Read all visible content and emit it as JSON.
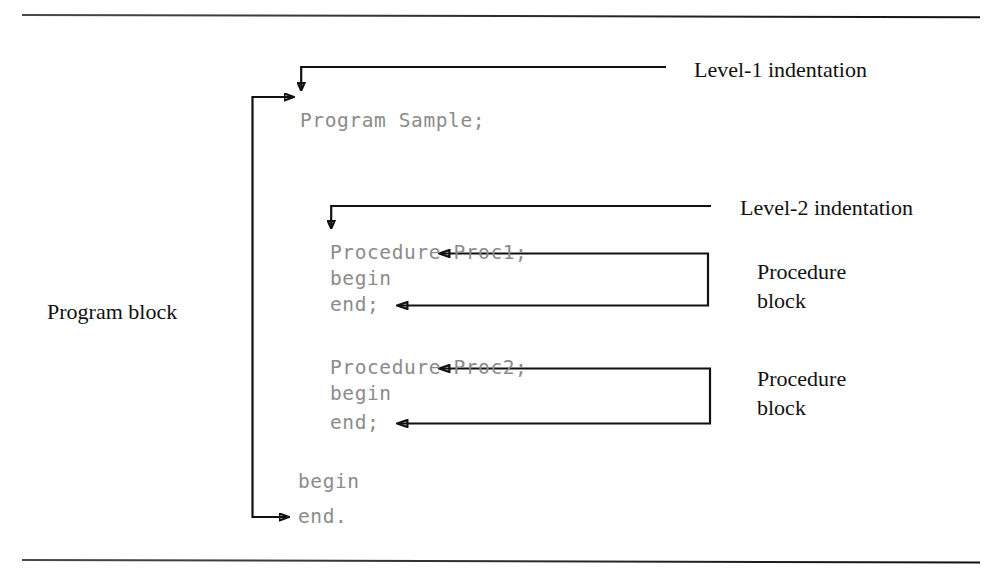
{
  "figure": {
    "type": "diagram",
    "background_color": "#ffffff",
    "line_color": "#111111",
    "code_text_color": "#8b8b8b",
    "label_text_color": "#111111"
  },
  "code_listing": {
    "lines": [
      {
        "text": "Program Sample;",
        "indent_level": 1
      },
      {
        "text": "Procedure Proc1;",
        "indent_level": 2
      },
      {
        "text": "begin",
        "indent_level": 2
      },
      {
        "text": "end;",
        "indent_level": 2
      },
      {
        "text": "Procedure Proc2;",
        "indent_level": 2
      },
      {
        "text": "begin",
        "indent_level": 2
      },
      {
        "text": "end;",
        "indent_level": 2
      },
      {
        "text": "begin",
        "indent_level": 1
      },
      {
        "text": "end.",
        "indent_level": 1
      }
    ],
    "l1_program_sample": "Program Sample;",
    "l2_procedure_proc1": "Procedure Proc1;",
    "l3_begin": "begin",
    "l4_end_semi": "end;",
    "l5_procedure_proc2": "Procedure Proc2;",
    "l6_begin": "begin",
    "l7_end_semi": "end;",
    "l8_begin": "begin",
    "l9_end_dot": "end."
  },
  "annotations": {
    "level1_indentation": "Level-1 indentation",
    "level2_indentation": "Level-2 indentation",
    "program_block": "Program block",
    "procedure_block_1_line1": "Procedure",
    "procedure_block_1_line2": "block",
    "procedure_block_2_line1": "Procedure",
    "procedure_block_2_line2": "block"
  },
  "connectors": [
    {
      "name": "level1-indent-pointer",
      "kind": "elbow-arrow",
      "points": "M 665 67 L 301 67 L 301 94",
      "arrow_at": "end-down"
    },
    {
      "name": "level2-indent-pointer",
      "kind": "elbow-arrow",
      "points": "M 710 206 L 331 206 L 331 232",
      "arrow_at": "end-down"
    },
    {
      "name": "program-block-bracket",
      "kind": "bracket",
      "points": "M 295 97 L 252 97 L 252 517 L 290 517",
      "arrow_at": "both-ends"
    },
    {
      "name": "procedure-block-1-bracket",
      "kind": "bracket",
      "points": "M 437 253 L 708 253 L 708 305 L 395 305",
      "arrow_at": "both-ends"
    },
    {
      "name": "procedure-block-2-bracket",
      "kind": "bracket",
      "points": "M 437 368 L 710 368 L 710 423 L 395 423",
      "arrow_at": "both-ends"
    }
  ]
}
